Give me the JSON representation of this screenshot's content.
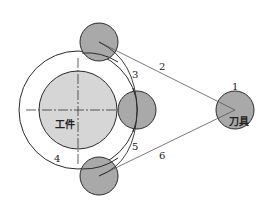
{
  "diagram": {
    "type": "tool-path-schematic",
    "colors": {
      "background": "#ffffff",
      "stroke": "#2a2a2a",
      "workpiece_fill": "#d6d6d6",
      "tool_fill": "#a9a9a9",
      "path_line": "#555555"
    },
    "labels": {
      "workpiece": "工件",
      "tool": "刀具",
      "n1": "1",
      "n2": "2",
      "n3": "3",
      "n4": "4",
      "n5": "5",
      "n6": "6"
    },
    "shapes": {
      "workpiece": {
        "cx": 78,
        "cy": 110,
        "r": 39
      },
      "outer_circle": {
        "cx": 78,
        "cy": 110,
        "r": 59
      },
      "tool_top": {
        "cx": 99,
        "cy": 42,
        "r": 19
      },
      "tool_middle": {
        "cx": 137,
        "cy": 110,
        "r": 19
      },
      "tool_bottom": {
        "cx": 99,
        "cy": 176,
        "r": 19
      },
      "tool_home": {
        "cx": 235,
        "cy": 110,
        "r": 19
      }
    }
  }
}
